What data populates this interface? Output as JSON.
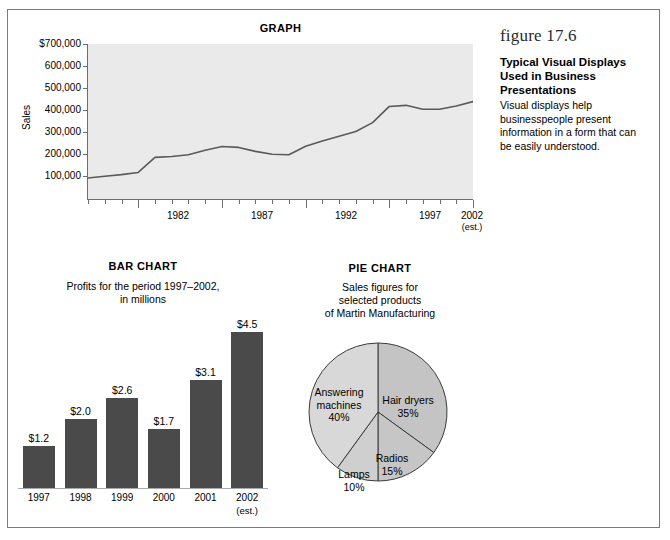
{
  "figure": {
    "number": "figure 17.6",
    "heading": "Typical Visual Displays Used in Business Presentations",
    "body": "Visual displays help businesspeople present information in a form that can be easily understood."
  },
  "chart_data": [
    {
      "type": "line",
      "title": "GRAPH",
      "xlabel": "",
      "ylabel": "Sales",
      "ylim": [
        0,
        700000
      ],
      "ytick_labels": [
        "$700,000",
        "600,000",
        "500,000",
        "400,000",
        "300,000",
        "200,000",
        "100,000"
      ],
      "ytick_values": [
        700000,
        600000,
        500000,
        400000,
        300000,
        200000,
        100000
      ],
      "xtick_labels": [
        "1982",
        "1987",
        "1992",
        "1997",
        "2002"
      ],
      "xtick_sublabel": "(est.)",
      "xlim": [
        1979,
        2002
      ],
      "x": [
        1979,
        1980,
        1981,
        1982,
        1983,
        1984,
        1985,
        1986,
        1987,
        1988,
        1989,
        1990,
        1991,
        1992,
        1993,
        1994,
        1995,
        1996,
        1997,
        1998,
        1999,
        2000,
        2001,
        2002
      ],
      "values": [
        95000,
        103000,
        110000,
        120000,
        188000,
        192000,
        200000,
        220000,
        237000,
        233000,
        215000,
        202000,
        200000,
        238000,
        262000,
        283000,
        305000,
        345000,
        418000,
        423000,
        405000,
        405000,
        420000,
        440000
      ],
      "grid": false,
      "legend": "none",
      "plot_bg": "#eaeaea",
      "line_color": "#5a5a5a"
    },
    {
      "type": "bar",
      "title": "BAR CHART",
      "subtitle": "Profits for the period 1997–2002, in millions",
      "categories": [
        "1997",
        "1998",
        "1999",
        "2000",
        "2001",
        "2002"
      ],
      "category_sublabels": [
        "",
        "",
        "",
        "",
        "",
        "(est.)"
      ],
      "values": [
        1.2,
        2.0,
        2.6,
        1.7,
        3.1,
        4.5
      ],
      "value_labels": [
        "$1.2",
        "$2.0",
        "$2.6",
        "$1.7",
        "$3.1",
        "$4.5"
      ],
      "xlabel": "",
      "ylabel": "",
      "ylim": [
        0,
        4.9
      ],
      "grid": false,
      "legend": "none",
      "bar_color": "#4a4a4a"
    },
    {
      "type": "pie",
      "title": "PIE CHART",
      "subtitle": "Sales figures for selected products of Martin Manufacturing",
      "categories": [
        "Hair dryers",
        "Radios",
        "Lamps",
        "Answering machines"
      ],
      "values": [
        35,
        15,
        10,
        40
      ],
      "value_labels": [
        "35%",
        "15%",
        "10%",
        "40%"
      ],
      "start_angle_deg": 0,
      "direction": "clockwise",
      "legend": "none",
      "slice_colors": [
        "#c4c4c4",
        "#c6c6c6",
        "#cfcfcf",
        "#d8d8d8"
      ]
    }
  ],
  "graph": {
    "title": "GRAPH",
    "ylabel": "Sales",
    "yticks": [
      "$700,000",
      "600,000",
      "500,000",
      "400,000",
      "300,000",
      "200,000",
      "100,000"
    ],
    "xticks": [
      "1982",
      "1987",
      "1992",
      "1997",
      "2002"
    ],
    "xtick_sub": "(est.)"
  },
  "bar": {
    "title": "BAR CHART",
    "subtitle_line1": "Profits for the period 1997–2002,",
    "subtitle_line2": "in millions",
    "bars": [
      {
        "label": "1997",
        "sub": "",
        "value_label": "$1.2"
      },
      {
        "label": "1998",
        "sub": "",
        "value_label": "$2.0"
      },
      {
        "label": "1999",
        "sub": "",
        "value_label": "$2.6"
      },
      {
        "label": "2000",
        "sub": "",
        "value_label": "$1.7"
      },
      {
        "label": "2001",
        "sub": "",
        "value_label": "$3.1"
      },
      {
        "label": "2002",
        "sub": "(est.)",
        "value_label": "$4.5"
      }
    ]
  },
  "pie": {
    "title": "PIE CHART",
    "subtitle_line1": "Sales figures for",
    "subtitle_line2": "selected products",
    "subtitle_line3": "of Martin Manufacturing",
    "slices": [
      {
        "name": "Hair dryers",
        "pct": "35%"
      },
      {
        "name": "Radios",
        "pct": "15%"
      },
      {
        "name": "Lamps",
        "pct": "10%"
      },
      {
        "name": "Answering machines",
        "pct": "40%"
      }
    ],
    "label_hair_line1": "Hair dryers",
    "label_hair_line2": "35%",
    "label_radios_line1": "Radios",
    "label_radios_line2": "15%",
    "label_lamps_line1": "Lamps",
    "label_lamps_line2": "10%",
    "label_answering_line1": "Answering",
    "label_answering_line2": "machines",
    "label_answering_line3": "40%"
  }
}
